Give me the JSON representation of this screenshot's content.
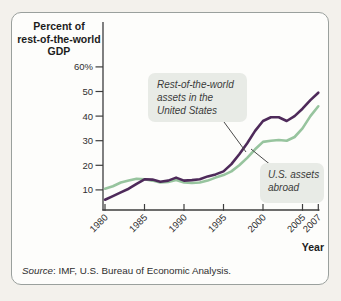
{
  "figure": {
    "y_axis_title_lines": [
      "Percent of",
      "rest-of-the-world",
      "GDP"
    ],
    "x_axis_title": "Year",
    "source_label": "Source",
    "source_rest": ": IMF, U.S. Bureau of Economic Analysis."
  },
  "annotations": [
    {
      "lines": [
        "Rest-of-the-world",
        "assets in the",
        "United States"
      ],
      "points_to": "Rest-of-the-world assets in the United States"
    },
    {
      "lines": [
        "U.S. assets",
        "abroad"
      ],
      "points_to": "U.S. assets abroad"
    }
  ],
  "colors": {
    "row_assets_line": "#4e2a5a",
    "us_assets_line": "#97c49e",
    "axis": "#3d3d3d",
    "annotation_bg": "#e8ebe6",
    "card_border": "#9aa09d",
    "card_bg": "#fdfdfb",
    "page_bg": "#f3f1ec"
  },
  "chart_data": {
    "type": "line",
    "title": "",
    "ylabel": "Percent of rest-of-the-world GDP",
    "xlabel": "Year",
    "ylim": [
      0,
      60
    ],
    "xlim": [
      1980,
      2007
    ],
    "grid": false,
    "legend": "inline-annotations",
    "x": [
      1980,
      1981,
      1982,
      1983,
      1984,
      1985,
      1986,
      1987,
      1988,
      1989,
      1990,
      1991,
      1992,
      1993,
      1994,
      1995,
      1996,
      1997,
      1998,
      1999,
      2000,
      2001,
      2002,
      2003,
      2004,
      2005,
      2006,
      2007
    ],
    "series": [
      {
        "name": "Rest-of-the-world assets in the United States",
        "color": "#4e2a5a",
        "values": [
          6,
          7.5,
          9,
          10.5,
          12.5,
          14.3,
          14.2,
          13.3,
          13.8,
          15,
          13.8,
          14,
          14.3,
          15.5,
          16.3,
          17.5,
          20.5,
          24.5,
          29,
          34,
          38,
          39.5,
          39.5,
          38,
          40,
          43,
          46.5,
          49.5
        ]
      },
      {
        "name": "U.S. assets abroad",
        "color": "#97c49e",
        "values": [
          10.5,
          11.5,
          13,
          13.8,
          14.5,
          14.3,
          13.8,
          13,
          13.2,
          14,
          13,
          12.8,
          13,
          13.8,
          15,
          16,
          17.5,
          20,
          23,
          26.5,
          29.5,
          30,
          30.3,
          30,
          31.5,
          35,
          40,
          44
        ]
      }
    ],
    "yticks": [
      {
        "v": 60,
        "label": "60%"
      },
      {
        "v": 50,
        "label": "50"
      },
      {
        "v": 40,
        "label": "40"
      },
      {
        "v": 30,
        "label": "30"
      },
      {
        "v": 20,
        "label": "20"
      },
      {
        "v": 10,
        "label": "10"
      }
    ],
    "xticks": [
      {
        "v": 1980,
        "label": "1980"
      },
      {
        "v": 1985,
        "label": "1985"
      },
      {
        "v": 1990,
        "label": "1990"
      },
      {
        "v": 1995,
        "label": "1995"
      },
      {
        "v": 2000,
        "label": "2000"
      },
      {
        "v": 2005,
        "label": "2005"
      },
      {
        "v": 2007,
        "label": "2007"
      }
    ],
    "source": "Source: IMF, U.S. Bureau of Economic Analysis."
  }
}
